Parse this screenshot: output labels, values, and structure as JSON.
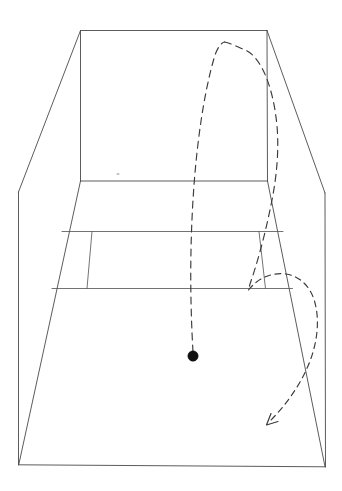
{
  "scene": {
    "title": "Court Trajectory Diagram",
    "description": "Hand-drawn perspective view of a tennis court with a dashed ball trajectory, a ball marker and a direction arrow",
    "background_color": "#ffffff",
    "line_color": "#4a4a4a",
    "trajectory_color": "#3a3a3a",
    "ball_color": "#111111"
  },
  "court": {
    "back_wall_label": "back wall",
    "back_wall_top_left": "80,30",
    "back_wall_top_right": "267,30",
    "back_wall_bottom_left": "80,181",
    "back_wall_bottom_right": "267,181",
    "near_baseline_left": "18,465",
    "near_baseline_right": "325,467",
    "left_side_kink": "18,192",
    "right_side_kink": "325,193",
    "service_line_far_left": "62,231",
    "service_line_far_right": "283,231",
    "service_line_near_left": "52,288",
    "service_line_near_right": "292,288",
    "service_box_divider_top": "92,231",
    "service_box_divider_bottom": "87,288",
    "right_service_divider_top": "259,231",
    "right_service_divider_bottom": "265,288",
    "center_mark_speck": "118,174"
  },
  "trajectory": {
    "incoming_label": "incoming ball path",
    "peak_label": "apex of arc",
    "peak_point": "224,42",
    "descending_label": "descending path",
    "return_loop_label": "return swing loop",
    "arrow_label": "direction of travel",
    "arrow_tip": "266,425",
    "dash_pattern_long": "7 5",
    "dash_pattern_medium": "6 4.5"
  },
  "ball": {
    "label": "ball",
    "x": 193,
    "y": 356,
    "radius": 5.2
  }
}
